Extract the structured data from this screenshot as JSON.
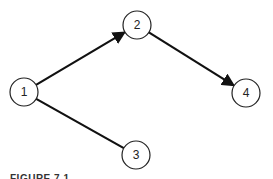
{
  "diagram": {
    "type": "directed-graph",
    "stroke_color": "#111111",
    "nodes": [
      {
        "id": "1",
        "label": "1",
        "cx": 24,
        "cy": 92,
        "r": 14
      },
      {
        "id": "2",
        "label": "2",
        "cx": 137,
        "cy": 25,
        "r": 14
      },
      {
        "id": "3",
        "label": "3",
        "cx": 136,
        "cy": 155,
        "r": 14
      },
      {
        "id": "4",
        "label": "4",
        "cx": 246,
        "cy": 93,
        "r": 14
      }
    ],
    "edges": [
      {
        "from": "1",
        "to": "2",
        "arrow": true
      },
      {
        "from": "2",
        "to": "4",
        "arrow": true
      },
      {
        "from": "1",
        "to": "3",
        "arrow": false
      }
    ]
  },
  "caption": "FIGURE 7.1"
}
